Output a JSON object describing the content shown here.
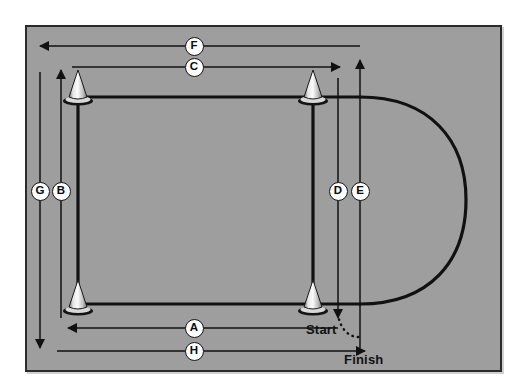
{
  "figure": {
    "type": "agility-test-course-diagram",
    "background_color": "#9e9e9e",
    "frame_border_color": "#2b2b2b",
    "line_color": "#111111",
    "marker_fill": "#ffffff",
    "marker_text_color": "#0a0a0a"
  },
  "labels": {
    "start": "Start",
    "finish": "Finish"
  },
  "markers": [
    {
      "id": "A",
      "letter": "A",
      "x": 194,
      "y": 328,
      "orientation": "horizontal",
      "direction": "left"
    },
    {
      "id": "B",
      "letter": "B",
      "x": 61,
      "y": 191,
      "orientation": "vertical",
      "direction": "up"
    },
    {
      "id": "C",
      "letter": "C",
      "x": 194,
      "y": 67,
      "orientation": "horizontal",
      "direction": "right"
    },
    {
      "id": "D",
      "letter": "D",
      "x": 338,
      "y": 191,
      "orientation": "vertical",
      "direction": "down"
    },
    {
      "id": "E",
      "letter": "E",
      "x": 360,
      "y": 191,
      "orientation": "vertical",
      "direction": "up"
    },
    {
      "id": "F",
      "letter": "F",
      "x": 194,
      "y": 46,
      "orientation": "horizontal",
      "direction": "left"
    },
    {
      "id": "G",
      "letter": "G",
      "x": 40,
      "y": 191,
      "orientation": "vertical",
      "direction": "down"
    },
    {
      "id": "H",
      "letter": "H",
      "x": 194,
      "y": 351,
      "orientation": "horizontal",
      "direction": "right"
    }
  ],
  "cones": [
    {
      "name": "cone-top-left",
      "x": 78,
      "y": 103
    },
    {
      "name": "cone-top-right",
      "x": 313,
      "y": 103
    },
    {
      "name": "cone-bottom-left",
      "x": 78,
      "y": 310
    },
    {
      "name": "cone-bottom-right",
      "x": 313,
      "y": 310
    }
  ],
  "course": {
    "top_line": {
      "x1": 78,
      "y1": 97,
      "x2": 360,
      "y2": 97
    },
    "bottom_line": {
      "x1": 78,
      "y1": 304,
      "x2": 360,
      "y2": 304
    },
    "left_line": {
      "x1": 78,
      "y1": 97,
      "x2": 78,
      "y2": 304
    },
    "right_line": {
      "x1": 313,
      "y1": 97,
      "x2": 313,
      "y2": 304
    },
    "u_turn": {
      "center_x": 360,
      "center_y": 200,
      "radius_x": 105,
      "radius_y": 104
    },
    "dotted_connector": {
      "from_x": 338,
      "from_y": 314,
      "to_x": 360,
      "to_y": 336
    }
  }
}
